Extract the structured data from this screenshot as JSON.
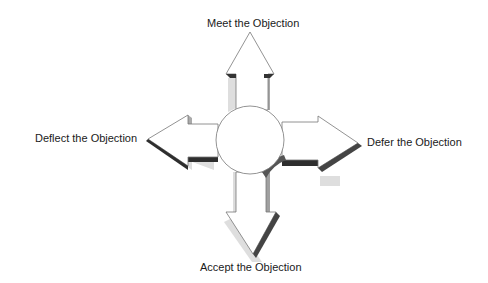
{
  "diagram": {
    "title": "",
    "center": {
      "shape": "circle",
      "label": ""
    },
    "arrows": [
      {
        "direction": "up",
        "label": "Meet the Objection"
      },
      {
        "direction": "left",
        "label": "Deflect the Objection"
      },
      {
        "direction": "right",
        "label": "Defer the Objection"
      },
      {
        "direction": "down",
        "label": "Accept the Objection"
      }
    ],
    "colors": {
      "fill": "#ffffff",
      "outline": "#777777",
      "shadow_light": "#d8d8d8",
      "shadow_mid": "#a0a0a0",
      "shadow_dark": "#3a3a3a"
    }
  }
}
